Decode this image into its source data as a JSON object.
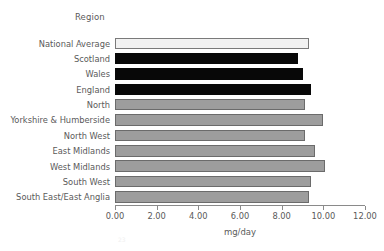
{
  "chart_data": {
    "type": "bar",
    "orientation": "horizontal",
    "title": "",
    "xlabel": "mg/day",
    "ylabel": "Region",
    "xlim": [
      0,
      12
    ],
    "xticks": [
      "0.00",
      "2.00",
      "4.00",
      "6.00",
      "8.00",
      "10.00",
      "12.00"
    ],
    "xtick_values": [
      0,
      2,
      4,
      6,
      8,
      10,
      12
    ],
    "grid": false,
    "legend": "none",
    "categories": [
      "National Average",
      "Scotland",
      "Wales",
      "England",
      "North",
      "Yorkshire & Humberside",
      "North West",
      "East Midlands",
      "West Midlands",
      "South West",
      "South East/East Anglia"
    ],
    "values": [
      9.3,
      8.8,
      9.0,
      9.4,
      9.1,
      10.0,
      9.1,
      9.6,
      10.1,
      9.4,
      9.3
    ],
    "bar_styles": [
      "national",
      "country",
      "country",
      "country",
      "region",
      "region",
      "region",
      "region",
      "region",
      "region",
      "region"
    ],
    "colors": {
      "national_fill": "#f2f2f2",
      "country_fill": "#080808",
      "region_fill": "#9d9d9d",
      "bar_edge": "#6b6b6b",
      "axis": "#8a8a8a",
      "text": "#5a5a5a",
      "background": "#ffffff"
    }
  },
  "artifact": {
    "page_number": "23"
  }
}
